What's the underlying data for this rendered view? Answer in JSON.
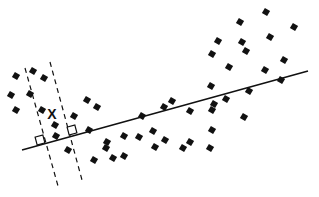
{
  "diagram": {
    "colors": {
      "ink": "#111111",
      "background": "#ffffff"
    },
    "points": [
      [
        16,
        76
      ],
      [
        33,
        71
      ],
      [
        44,
        78
      ],
      [
        11,
        95
      ],
      [
        30,
        94
      ],
      [
        16,
        110
      ],
      [
        42,
        110
      ],
      [
        55,
        125
      ],
      [
        56,
        136
      ],
      [
        74,
        116
      ],
      [
        87,
        100
      ],
      [
        97,
        107
      ],
      [
        89,
        130
      ],
      [
        68,
        150
      ],
      [
        94,
        160
      ],
      [
        107,
        142
      ],
      [
        106,
        148
      ],
      [
        113,
        158
      ],
      [
        124,
        136
      ],
      [
        124,
        156
      ],
      [
        142,
        116
      ],
      [
        139,
        137
      ],
      [
        153,
        131
      ],
      [
        164,
        107
      ],
      [
        155,
        147
      ],
      [
        165,
        140
      ],
      [
        172,
        101
      ],
      [
        183,
        148
      ],
      [
        190,
        111
      ],
      [
        190,
        142
      ],
      [
        211,
        86
      ],
      [
        214,
        104
      ],
      [
        212,
        110
      ],
      [
        212,
        130
      ],
      [
        210,
        148
      ],
      [
        226,
        99
      ],
      [
        229,
        67
      ],
      [
        218,
        41
      ],
      [
        212,
        54
      ],
      [
        240,
        22
      ],
      [
        242,
        42
      ],
      [
        246,
        51
      ],
      [
        249,
        91
      ],
      [
        244,
        117
      ],
      [
        265,
        70
      ],
      [
        266,
        12
      ],
      [
        270,
        37
      ],
      [
        281,
        80
      ],
      [
        284,
        60
      ],
      [
        294,
        27
      ]
    ],
    "query_point_label": "X",
    "legend": []
  }
}
